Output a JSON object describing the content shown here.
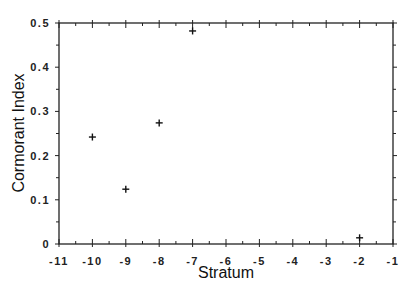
{
  "chart_data": {
    "type": "scatter",
    "title": "",
    "xlabel": "Stratum",
    "ylabel": "Cormorant Index",
    "xlim": [
      -11,
      -1
    ],
    "ylim": [
      0,
      0.5
    ],
    "grid": false,
    "legend": null,
    "marker": "+",
    "x_ticks": [
      -11,
      -10,
      -9,
      -8,
      -7,
      -6,
      -5,
      -4,
      -3,
      -2,
      -1
    ],
    "x_tick_labels": [
      "-11",
      "-10",
      "-9",
      "-8",
      "-7",
      "-6",
      "-5",
      "-4",
      "-3",
      "-2",
      "-1"
    ],
    "y_ticks": [
      0,
      0.1,
      0.2,
      0.3,
      0.4,
      0.5
    ],
    "y_tick_labels": [
      "0",
      "0.1",
      "0.2",
      "0.3",
      "0.4",
      "0.5"
    ],
    "series": [
      {
        "name": "Cormorant Index",
        "points": [
          {
            "x": -10,
            "y": 0.242
          },
          {
            "x": -9,
            "y": 0.124
          },
          {
            "x": -8,
            "y": 0.274
          },
          {
            "x": -7,
            "y": 0.482
          },
          {
            "x": -2,
            "y": 0.014
          }
        ]
      }
    ]
  }
}
